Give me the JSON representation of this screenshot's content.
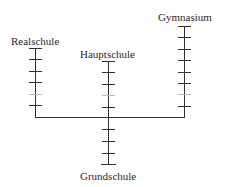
{
  "diagram": {
    "type": "school-system-tree",
    "colors": {
      "line": "#333333",
      "text": "#2a2a2a",
      "background": "#ffffff"
    },
    "nodes": [
      {
        "id": "realschule",
        "label": "Realschule",
        "position": "left-branch",
        "grades": 6
      },
      {
        "id": "hauptschule",
        "label": "Hauptschule",
        "position": "middle-branch",
        "grades": 5
      },
      {
        "id": "gymnasium",
        "label": "Gymnasium",
        "position": "right-branch",
        "grades": 8
      },
      {
        "id": "grundschule",
        "label": "Grundschule",
        "position": "trunk",
        "grades": 4
      }
    ],
    "edges": [
      {
        "from": "grundschule",
        "to": "realschule"
      },
      {
        "from": "grundschule",
        "to": "hauptschule"
      },
      {
        "from": "grundschule",
        "to": "gymnasium"
      }
    ]
  },
  "labels": {
    "realschule": "Realschule",
    "hauptschule": "Hauptschule",
    "gymnasium": "Gymnasium",
    "grundschule": "Grundschule"
  }
}
